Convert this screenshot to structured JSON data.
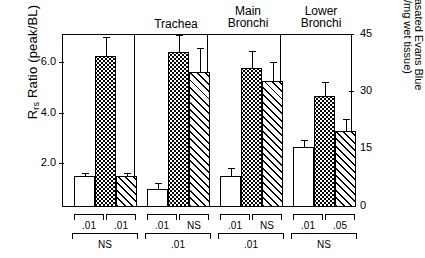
{
  "chart_data": {
    "type": "bar",
    "title": "",
    "categories": [
      "",
      "Trachea",
      "Main Bronchi",
      "Lower Bronchi"
    ],
    "group_labels": [
      "",
      "Trachea",
      "Main\nBronchi",
      "Lower\nBronchi"
    ],
    "series": [
      {
        "name": "bar-1-open",
        "pattern": "open",
        "values": [
          1.2,
          0.7,
          1.2,
          2.35
        ],
        "errors": [
          0.12,
          0.25,
          0.35,
          0.3
        ]
      },
      {
        "name": "bar-2-dotted",
        "pattern": "dotted",
        "values": [
          5.95,
          6.1,
          5.45,
          4.35
        ],
        "errors": [
          0.75,
          0.65,
          0.7,
          0.55
        ]
      },
      {
        "name": "bar-3-hatched",
        "pattern": "diagonal",
        "values": [
          1.2,
          5.3,
          4.95,
          3.0
        ],
        "errors": [
          0.12,
          0.95,
          0.75,
          0.45
        ]
      }
    ],
    "ylabel_left": "R",
    "ylabel_left_sub": "rs",
    "ylabel_left_rest": " Ratio (peak/BL)",
    "ylabel_right": "Extravasated Evans Blue",
    "ylabel_right_units": "(ng/mg wet tissue)",
    "yticks_left": [
      "2.0",
      "4.0",
      "6.0"
    ],
    "yticks_left_values": [
      2.0,
      4.0,
      6.0
    ],
    "ylim_left": [
      0,
      6.8
    ],
    "yticks_right": [
      "0",
      "15",
      "30",
      "45"
    ],
    "yticks_right_values": [
      0,
      15,
      30,
      45
    ],
    "ylim_right": [
      0,
      45
    ],
    "xlabel": "",
    "grid": false,
    "legend": "none",
    "annotations": [
      {
        "group": 0,
        "level": "upper",
        "left": ".01",
        "right": ".01",
        "lower": "NS"
      },
      {
        "group": 1,
        "level": "upper",
        "left": ".01",
        "right": "NS",
        "lower": ".01"
      },
      {
        "group": 2,
        "level": "upper",
        "left": ".01",
        "right": "NS",
        "lower": ".01"
      },
      {
        "group": 3,
        "level": "upper",
        "left": ".01",
        "right": ".05",
        "lower": "NS"
      }
    ]
  },
  "axes": {
    "left_title_main": "R",
    "left_title_sub": "rs",
    "left_title_tail": " Ratio (peak/BL)",
    "right_title_line1": "Extravasated Evans Blue",
    "right_title_line2": "(ng/mg wet tissue)",
    "left_ticks": [
      "6.0",
      "4.0",
      "2.0"
    ],
    "right_ticks": [
      "45",
      "30",
      "15",
      "0"
    ]
  },
  "groups": [
    {
      "label_line1": "",
      "label_line2": ""
    },
    {
      "label_line1": "Trachea",
      "label_line2": ""
    },
    {
      "label_line1": "Main",
      "label_line2": "Bronchi"
    },
    {
      "label_line1": "Lower",
      "label_line2": "Bronchi"
    }
  ],
  "significance": [
    {
      "upper_left": ".01",
      "upper_right": ".01",
      "lower": "NS"
    },
    {
      "upper_left": ".01",
      "upper_right": "NS",
      "lower": ".01"
    },
    {
      "upper_left": ".01",
      "upper_right": "NS",
      "lower": ".01"
    },
    {
      "upper_left": ".01",
      "upper_right": ".05",
      "lower": "NS"
    }
  ]
}
